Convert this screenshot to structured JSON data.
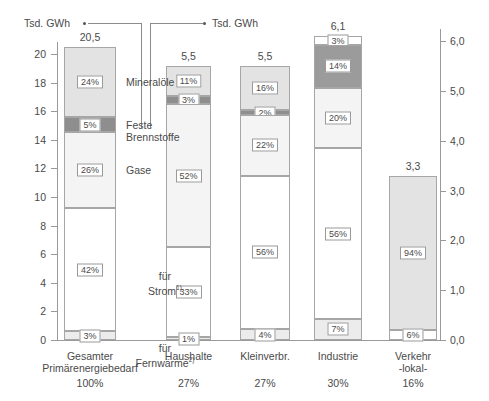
{
  "header": {
    "left_unit": "Tsd. GWh",
    "right_unit": "Tsd. GWh"
  },
  "left_axis": {
    "ticks": [
      "20",
      "18",
      "16",
      "14",
      "12",
      "10",
      "8",
      "6",
      "4",
      "2",
      "0"
    ],
    "values": [
      20,
      18,
      16,
      14,
      12,
      10,
      8,
      6,
      4,
      2,
      0
    ],
    "max": 21.0,
    "min": 0
  },
  "right_axis": {
    "ticks": [
      "6,0",
      "5,0",
      "4,0",
      "3,0",
      "2,0",
      "1,0",
      "0,0"
    ],
    "values": [
      6.0,
      5.0,
      4.0,
      3.0,
      2.0,
      1.0,
      0.0
    ],
    "max": 6.3,
    "min": 0
  },
  "legend": {
    "oil": "Mineralöle",
    "solid": "Feste\nBrennstoffe",
    "gas": "Gase",
    "electricity": "für\nStrom",
    "electricity_fn": "1)",
    "districtheat": "für\nFernwärme",
    "districtheat_fn": "2)"
  },
  "chart_data": {
    "type": "bar",
    "title": "",
    "xlabel": "",
    "ylabel": "Tsd. GWh",
    "ylim": [
      0,
      21.0
    ],
    "ylim_right": [
      0,
      6.3
    ],
    "grid": false,
    "legend_position": "inline-right-of-first-bar",
    "stacked": true,
    "series": [
      {
        "name": "Mineralöle",
        "key": "oil",
        "color": "#e3e3e3"
      },
      {
        "name": "Feste Brennstoffe",
        "key": "solid",
        "color": "#8e8e8e"
      },
      {
        "name": "Gase",
        "key": "gas",
        "color": "#f4f4f4"
      },
      {
        "name": "für Strom",
        "key": "elec",
        "color": "#ffffff"
      },
      {
        "name": "für Fernwärme",
        "key": "heat",
        "color": "#ececec"
      }
    ],
    "categories": [
      {
        "label": "Gesamter\nPrimärenergiebedarf",
        "share": "100%",
        "total": "20,5",
        "total_value": 20.5,
        "axis": "left",
        "segments": [
          {
            "key": "oil",
            "pct": "24%",
            "value": 24
          },
          {
            "key": "solid",
            "pct": "5%",
            "value": 5
          },
          {
            "key": "gas",
            "pct": "26%",
            "value": 26
          },
          {
            "key": "elec",
            "pct": "42%",
            "value": 42
          },
          {
            "key": "heat",
            "pct": "3%",
            "value": 3
          }
        ]
      },
      {
        "label": "Haushalte",
        "share": "27%",
        "total": "5,5",
        "total_value": 5.5,
        "axis": "right",
        "segments": [
          {
            "key": "oil",
            "pct": "11%",
            "value": 11
          },
          {
            "key": "solid",
            "pct": "3%",
            "value": 3
          },
          {
            "key": "gas",
            "pct": "52%",
            "value": 52
          },
          {
            "key": "elec",
            "pct": "33%",
            "value": 33
          },
          {
            "key": "heat",
            "pct": "1%",
            "value": 1
          }
        ]
      },
      {
        "label": "Kleinverbr.",
        "share": "27%",
        "total": "5,5",
        "total_value": 5.5,
        "axis": "right",
        "segments": [
          {
            "key": "oil",
            "pct": "16%",
            "value": 16
          },
          {
            "key": "solid",
            "pct": "2%",
            "value": 2
          },
          {
            "key": "gas",
            "pct": "22%",
            "value": 22
          },
          {
            "key": "elec",
            "pct": "56%",
            "value": 56
          },
          {
            "key": "heat",
            "pct": "4%",
            "value": 4
          }
        ]
      },
      {
        "label": "Industrie",
        "share": "30%",
        "total": "6,1",
        "total_value": 6.1,
        "axis": "right",
        "segments": [
          {
            "key": "oil",
            "pct": "3%",
            "value": 3
          },
          {
            "key": "solid",
            "pct": "14%",
            "value": 14
          },
          {
            "key": "gas",
            "pct": "20%",
            "value": 20
          },
          {
            "key": "elec",
            "pct": "56%",
            "value": 56
          },
          {
            "key": "heat",
            "pct": "7%",
            "value": 7
          }
        ]
      },
      {
        "label": "Verkehr\n-lokal-",
        "share": "16%",
        "total": "3,3",
        "total_value": 3.3,
        "axis": "right",
        "segments": [
          {
            "key": "oil",
            "pct": "94%",
            "value": 94
          },
          {
            "key": "elec",
            "pct": "6%",
            "value": 6
          }
        ]
      }
    ]
  }
}
